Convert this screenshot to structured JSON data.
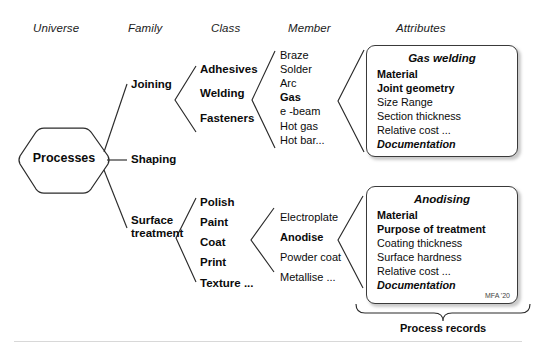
{
  "diagram": {
    "headers": [
      {
        "label": "Universe",
        "x": 33,
        "y": 22
      },
      {
        "label": "Family",
        "x": 128,
        "y": 22
      },
      {
        "label": "Class",
        "x": 211,
        "y": 22
      },
      {
        "label": "Member",
        "x": 288,
        "y": 22
      },
      {
        "label": "Attributes",
        "x": 396,
        "y": 22
      }
    ],
    "root": {
      "label": "Processes"
    },
    "families": [
      {
        "label": "Joining",
        "x": 131,
        "y": 84
      },
      {
        "label": "Shaping",
        "x": 131,
        "y": 154
      },
      {
        "label": "Surface treatment",
        "line1": "Surface",
        "line2": "treatment",
        "x": 131,
        "y": 220
      }
    ],
    "classes_joining": [
      {
        "label": "Adhesives",
        "bold": true
      },
      {
        "label": "Welding",
        "bold": true
      },
      {
        "label": "Fasteners",
        "bold": true
      }
    ],
    "classes_surface": [
      {
        "label": "Polish",
        "bold": true
      },
      {
        "label": "Paint",
        "bold": true
      },
      {
        "label": "Coat",
        "bold": true
      },
      {
        "label": "Print",
        "bold": true
      },
      {
        "label": "Texture ...",
        "bold": true
      }
    ],
    "members_welding": [
      {
        "label": "Braze",
        "emphasis": false
      },
      {
        "label": "Solder",
        "emphasis": false
      },
      {
        "label": "Arc",
        "emphasis": false
      },
      {
        "label": "Gas",
        "emphasis": true
      },
      {
        "label": "e -beam",
        "emphasis": false
      },
      {
        "label": "Hot gas",
        "emphasis": false
      },
      {
        "label": "Hot bar...",
        "emphasis": false
      }
    ],
    "members_coat": [
      {
        "label": "Electroplate",
        "emphasis": false
      },
      {
        "label": "Anodise",
        "emphasis": true
      },
      {
        "label": "Powder coat",
        "emphasis": false
      },
      {
        "label": "Metallise ...",
        "emphasis": false
      }
    ],
    "cards": [
      {
        "title": "Gas welding",
        "rows": [
          {
            "text": "Material",
            "style": "b"
          },
          {
            "text": "Joint geometry",
            "style": "b"
          },
          {
            "text": "Size Range",
            "style": ""
          },
          {
            "text": "Section thickness",
            "style": ""
          },
          {
            "text": "Relative cost ...",
            "style": ""
          },
          {
            "text": "Documentation",
            "style": "bi"
          }
        ],
        "credit": ""
      },
      {
        "title": "Anodising",
        "rows": [
          {
            "text": "Material",
            "style": "b"
          },
          {
            "text": "Purpose of treatment",
            "style": "b"
          },
          {
            "text": "Coating thickness",
            "style": ""
          },
          {
            "text": "Surface hardness",
            "style": ""
          },
          {
            "text": "Relative cost   ...",
            "style": ""
          },
          {
            "text": "Documentation",
            "style": "bi"
          }
        ],
        "credit": "MFA '20"
      }
    ],
    "brace_caption": "Process records",
    "colors": {
      "stroke": "#2b2b2b",
      "card_border": "#3a3a3a",
      "text": "#0b0b0b",
      "rule": "#d8d8d8",
      "background": "#ffffff"
    }
  }
}
